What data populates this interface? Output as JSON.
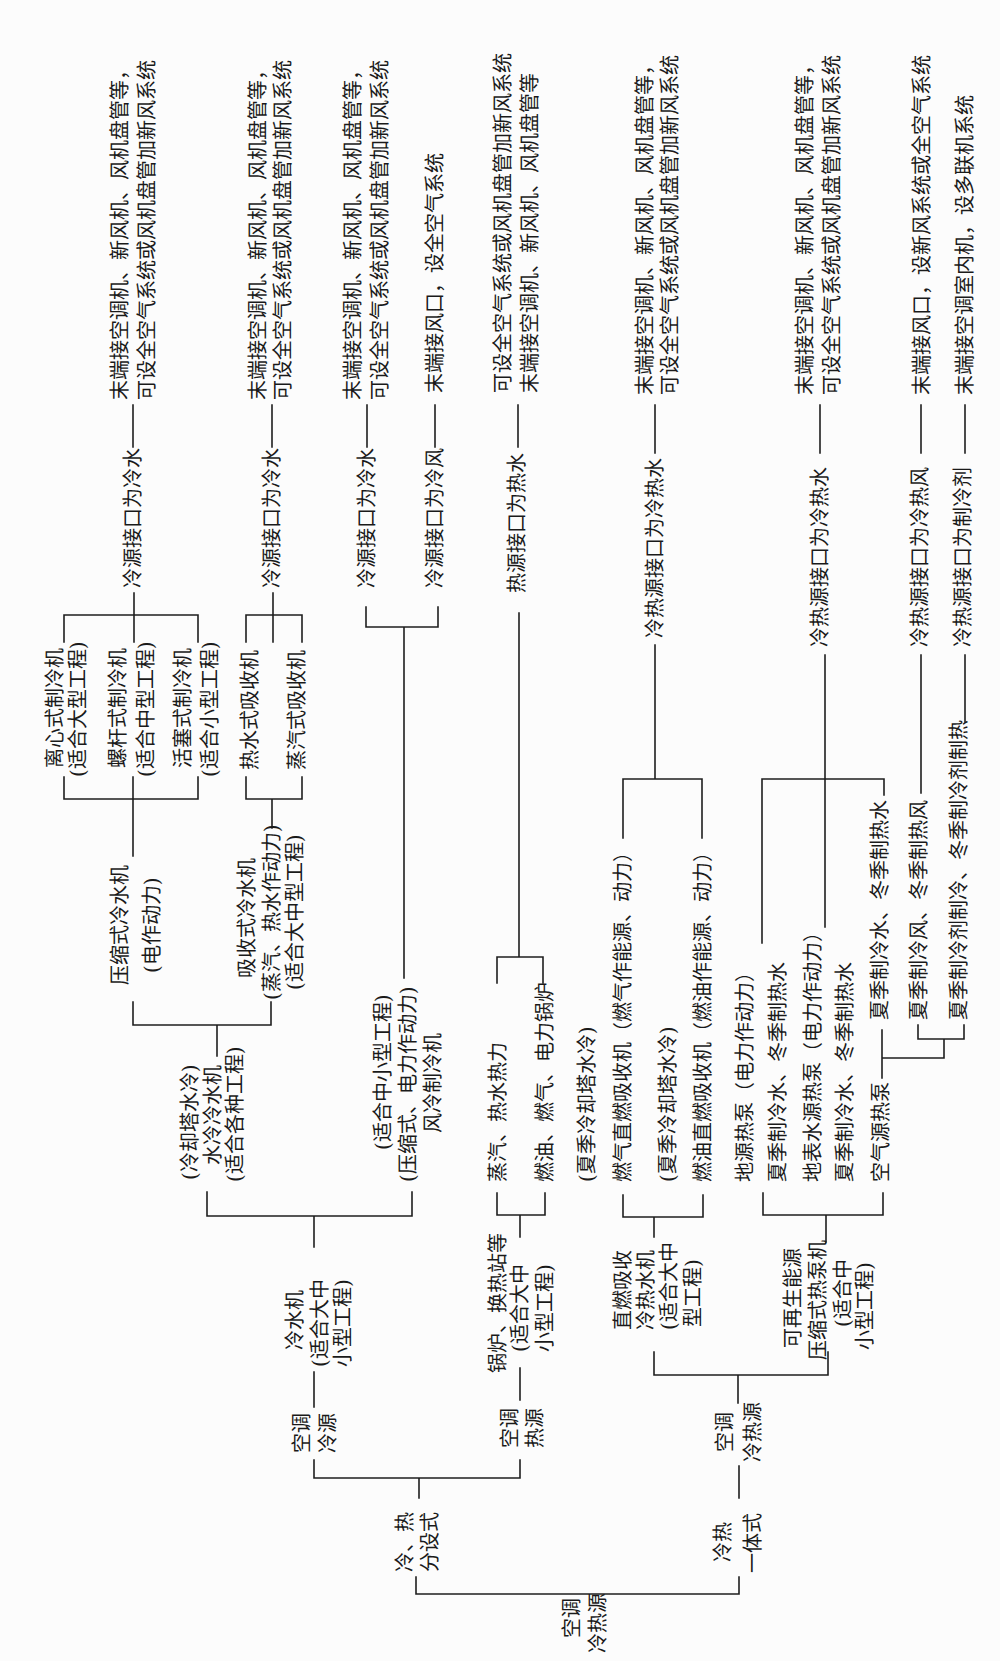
{
  "colors": {
    "line": "#1e1e1e",
    "text": "#1a1a1a",
    "background": "#fcfcfc"
  },
  "diagram": {
    "root": {
      "lines": [
        "空调",
        "冷热源"
      ]
    },
    "separate": {
      "lines": [
        "冷、热",
        "分设式"
      ],
      "cold_source": {
        "lines": [
          "空调",
          "冷源"
        ],
        "chiller": {
          "lines": [
            "冷水机",
            "(适合大中",
            "小型工程)"
          ],
          "water_cooled": {
            "lines": [
              "(冷却塔水冷)",
              "水冷冷水机",
              "(适合各种工程)"
            ],
            "compression": {
              "lines": [
                "压缩式冷水机",
                "(电作动力)"
              ],
              "types": [
                {
                  "lines": [
                    "离心式制冷机",
                    "(适合大型工程)"
                  ]
                },
                {
                  "lines": [
                    "螺杆式制冷机",
                    "(适合中型工程)"
                  ]
                },
                {
                  "lines": [
                    "活塞式制冷机",
                    "(适合小型工程)"
                  ]
                }
              ],
              "interface": "冷源接口为冷水",
              "terminal": [
                "末端接空调机、新风机、风机盘管等，",
                "可设全空气系统或风机盘管加新风系统"
              ]
            },
            "absorption": {
              "lines": [
                "吸收式冷水机",
                "(蒸汽、热水作动力)",
                "(适合大中型工程)"
              ],
              "types": [
                {
                  "lines": [
                    "热水式吸收机"
                  ]
                },
                {
                  "lines": [
                    "蒸汽式吸收机"
                  ]
                }
              ],
              "interface": "冷源接口为冷水",
              "terminal": [
                "末端接空调机、新风机、风机盘管等，",
                "可设全空气系统或风机盘管加新风系统"
              ]
            }
          },
          "air_cooled": {
            "lines": [
              "(适合中小型工程)",
              "(压缩式、电力作动力)",
              "风冷制冷机"
            ],
            "outputs": [
              {
                "interface": "冷源接口为冷水",
                "terminal": [
                  "末端接空调机、新风机、风机盘管等，",
                  "可设全空气系统或风机盘管加新风系统"
                ]
              },
              {
                "interface": "冷源接口为冷风",
                "terminal": [
                  "末端接风口，设全空气系统"
                ]
              }
            ]
          }
        }
      },
      "heat_source": {
        "lines": [
          "空调",
          "热源"
        ],
        "boiler": {
          "lines": [
            "锅炉、换热站等",
            "(适合大中",
            "小型工程)"
          ],
          "types": [
            {
              "lines": [
                "蒸汽、热水热力"
              ]
            },
            {
              "lines": [
                "燃油、燃气、电力锅炉"
              ]
            }
          ],
          "interface": "热源接口为热水",
          "terminal": [
            "可设全空气系统或风机盘管加新风系统",
            "末端接空调机、新风机、风机盘管等"
          ]
        }
      }
    },
    "integrated": {
      "lines": [
        "冷热",
        "一体式"
      ],
      "source": {
        "lines": [
          "空调",
          "冷热源"
        ],
        "direct_fired": {
          "lines": [
            "直燃吸收",
            "冷热水机",
            "(适合大中",
            "型工程)"
          ],
          "types": [
            {
              "lines": [
                "(夏季冷却塔水冷)",
                "燃气直燃吸收机（燃气作能源、动力）"
              ]
            },
            {
              "lines": [
                "(夏季冷却塔水冷)",
                "燃油直燃吸收机（燃油作能源、动力）"
              ]
            }
          ],
          "interface": "冷热源接口为冷热水",
          "terminal": [
            "末端接空调机、新风机、风机盘管等，",
            "可设全空气系统或风机盘管加新风系统"
          ]
        },
        "heat_pump": {
          "lines": [
            "可再生能源",
            "压缩式热泵机",
            "(适合中",
            "小型工程)"
          ],
          "types": [
            {
              "lines": [
                "地源热泵（电力作动力）",
                "夏季制冷水、冬季制热水"
              ]
            },
            {
              "lines": [
                "地表水源热泵（电力作动力）",
                "夏季制冷水、冬季制热水"
              ]
            },
            {
              "lines": [
                "空气源热泵"
              ],
              "modes": [
                {
                  "lines": [
                    "夏季制冷水、冬季制热水"
                  ]
                },
                {
                  "lines": [
                    "夏季制冷风、冬季制热风"
                  ]
                },
                {
                  "lines": [
                    "夏季制冷剂制冷、冬季制冷剂制热"
                  ]
                }
              ]
            }
          ],
          "outputs": [
            {
              "interface": "冷热源接口为冷热水",
              "terminal": [
                "末端接空调机、新风机、风机盘管等，",
                "可设全空气系统或风机盘管加新风系统"
              ]
            },
            {
              "interface": "冷热源接口为冷热风",
              "terminal": [
                "末端接风口，设新风系统或全空气系统"
              ]
            },
            {
              "interface": "冷热源接口为制冷剂",
              "terminal": [
                "末端接空调室内机，设多联机系统"
              ]
            }
          ]
        }
      }
    }
  }
}
